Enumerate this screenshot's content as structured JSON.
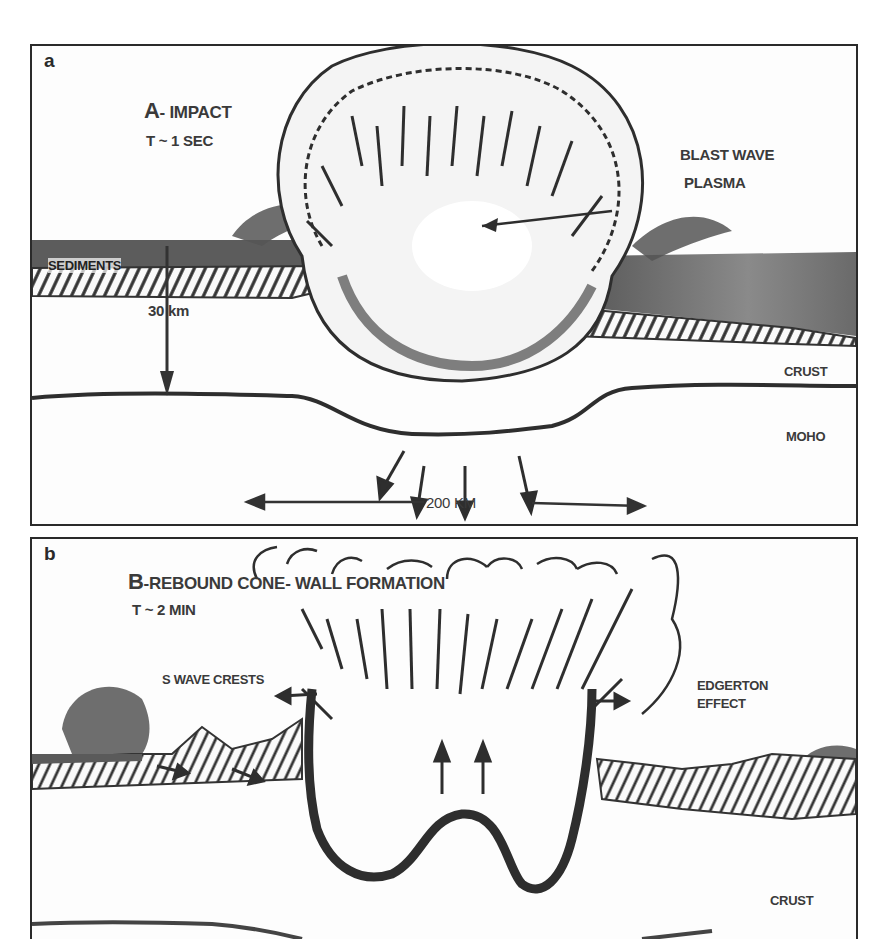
{
  "figure": {
    "panels": [
      {
        "id": "a",
        "label": "a",
        "title_prefix": "A",
        "title": "- IMPACT",
        "time": "T ~ 1 SEC",
        "annotations": {
          "blast_wave": "BLAST WAVE",
          "plasma": "PLASMA",
          "sediments": "SEDIMENTS",
          "depth": "30 km",
          "crust": "CRUST",
          "moho": "MOHO",
          "scale": "200 KM"
        }
      },
      {
        "id": "b",
        "label": "b",
        "title_prefix": "B",
        "title": "-REBOUND CONE- WALL FORMATION",
        "time": "T ~ 2 MIN",
        "annotations": {
          "s_wave_crests": "S WAVE CRESTS",
          "edgerton_line1": "EDGERTON",
          "edgerton_line2": "EFFECT",
          "crust": "CRUST"
        }
      }
    ]
  },
  "colors": {
    "ink": "#2e2e2e",
    "sediment_fill": "#7a7a7a",
    "hatch": "#3a3a3a",
    "paper": "#fdfdfd"
  }
}
